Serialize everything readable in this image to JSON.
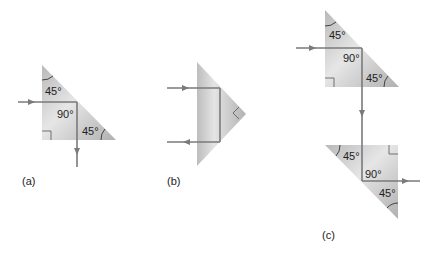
{
  "diagram": {
    "colors": {
      "prism_light": "#e4e4e4",
      "prism_dark": "#b4b4b4",
      "ray": "#7a7a7a",
      "text": "#222222",
      "background": "#ffffff"
    },
    "panels": [
      {
        "id": "a",
        "caption": "(a)",
        "description": "45-90-45 prism, ray enters left face, totally reflected at hypotenuse, exits downward through bottom face (90 degree deviation)",
        "angles": {
          "top": "45°",
          "right_angle": "90°",
          "bottom_right": "45°"
        }
      },
      {
        "id": "b",
        "caption": "(b)",
        "description": "prism with hypotenuse facing left, ray enters, reflects twice, exits reversed (180 degree deviation)"
      },
      {
        "id": "c",
        "caption": "(c)",
        "description": "two prisms forming a periscope; ray shifted down and continues in original direction",
        "top_prism_angles": {
          "top": "45°",
          "right_angle": "90°",
          "bottom_right": "45°"
        },
        "bottom_prism_angles": {
          "top_left": "45°",
          "right_angle": "90°",
          "bottom_right": "45°"
        }
      }
    ]
  }
}
